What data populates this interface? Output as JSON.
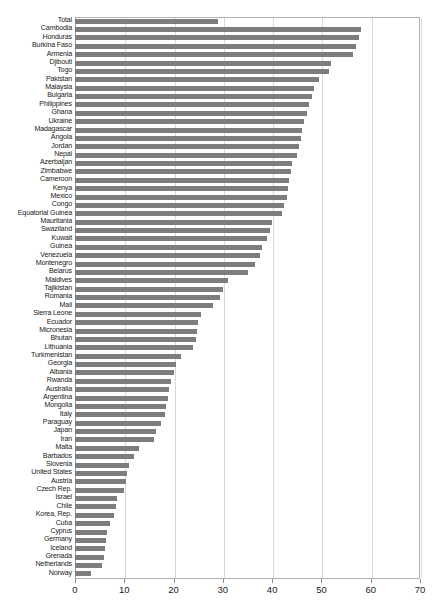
{
  "chart_data": {
    "type": "bar",
    "orientation": "horizontal",
    "title": "",
    "subtitle": "",
    "xlabel": "",
    "ylabel": "",
    "xlim": [
      0,
      70
    ],
    "xticks": [
      0,
      10,
      20,
      30,
      40,
      50,
      60,
      70
    ],
    "xtick_labels": [
      "0",
      "10",
      "20",
      "30",
      "40",
      "50",
      "60",
      "70"
    ],
    "grid": true,
    "grid_axis": "x",
    "legend": false,
    "bar_color": "#7d7d7d",
    "categories": [
      "Total",
      "Cambodia",
      "Honduras",
      "Burkina Faso",
      "Armenia",
      "Djibouti",
      "Togo",
      "Pakistan",
      "Malaysia",
      "Bulgaria",
      "Philippines",
      "Ghana",
      "Ukraine",
      "Madagascar",
      "Angola",
      "Jordan",
      "Nepal",
      "Azerbaijan",
      "Zimbabwe",
      "Cameroon",
      "Kenya",
      "Mexico",
      "Congo",
      "Equatorial Guinea",
      "Mauritania",
      "Swaziland",
      "Kuwait",
      "Guinea",
      "Venezuela",
      "Montenegro",
      "Belarus",
      "Maldives",
      "Tajikistan",
      "Romania",
      "Mali",
      "Sierra Leone",
      "Ecuador",
      "Micronesia",
      "Bhutan",
      "Lithuania",
      "Turkmenistan",
      "Georgia",
      "Albania",
      "Rwanda",
      "Australia",
      "Argentina",
      "Mongolia",
      "Italy",
      "Paraguay",
      "Japan",
      "Iran",
      "Malta",
      "Barbados",
      "Slovenia",
      "United States",
      "Austria",
      "Czech Rep.",
      "Israel",
      "Chile",
      "Korea, Rep.",
      "Cuba",
      "Cyprus",
      "Germany",
      "Iceland",
      "Grenada",
      "Netherlands",
      "Norway"
    ],
    "values": [
      29.1,
      58.0,
      57.6,
      57.0,
      56.4,
      52.0,
      51.5,
      49.5,
      48.5,
      48.0,
      47.5,
      47.0,
      46.5,
      46.0,
      45.8,
      45.5,
      45.0,
      44.0,
      43.8,
      43.5,
      43.2,
      43.0,
      42.5,
      42.0,
      40.0,
      39.5,
      39.0,
      38.0,
      37.5,
      36.5,
      35.0,
      31.0,
      30.0,
      29.5,
      28.0,
      25.5,
      25.0,
      24.8,
      24.5,
      24.0,
      21.5,
      20.5,
      20.0,
      19.5,
      19.0,
      18.8,
      18.5,
      18.2,
      17.5,
      16.5,
      16.0,
      13.0,
      12.0,
      11.0,
      10.5,
      10.3,
      10.0,
      8.5,
      8.3,
      8.0,
      7.0,
      6.5,
      6.2,
      6.0,
      5.8,
      5.5,
      3.2
    ]
  }
}
